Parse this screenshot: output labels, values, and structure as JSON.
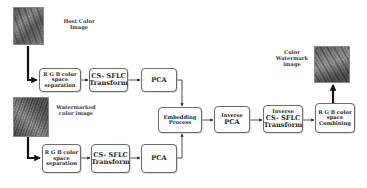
{
  "diagram": {
    "host_image": {
      "label_line1": "Host Color",
      "label_line2": "Image"
    },
    "watermarked_image": {
      "label_line1": "Watermarked",
      "label_line2": "color image"
    },
    "result_image": {
      "label_line1": "Color",
      "label_line2": "Watermark",
      "label_line3": "image"
    },
    "top_row": {
      "rgb_sep": {
        "line1": "R G B color",
        "line2": "space",
        "line3": "separation"
      },
      "cs_sflc": {
        "line1": "CS- SFLC",
        "line2": "Transform"
      },
      "pca": {
        "line1": "PCA"
      }
    },
    "bottom_row": {
      "rgb_sep": {
        "line1": "R G B color",
        "line2": "space",
        "line3": "separation"
      },
      "cs_sflc": {
        "line1": "CS- SFLC",
        "line2": "Transform"
      },
      "pca": {
        "line1": "PCA"
      }
    },
    "embedding": {
      "line1": "Embedding",
      "line2": "Process"
    },
    "inverse_pca": {
      "line1": "Inverse",
      "line2": "PCA"
    },
    "inverse_cs_sflc": {
      "line1": "Inverse",
      "line2": "CS- SFLC",
      "line3": "Transform"
    },
    "rgb_combine": {
      "line1": "R G B color",
      "line2": "space",
      "line3": "Combining"
    },
    "colors": {
      "line": "#222222",
      "box_border": "#6a6a6a",
      "text": "#2a2a2a",
      "background": "#ffffff"
    }
  }
}
